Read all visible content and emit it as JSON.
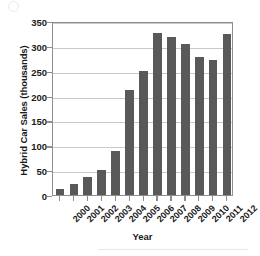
{
  "chart_data": {
    "type": "bar",
    "title": "",
    "xlabel": "Year",
    "ylabel": "Hybrid Car Sales (thousands)",
    "categories": [
      "2000",
      "2001",
      "2002",
      "2003",
      "2004",
      "2005",
      "2006",
      "2007",
      "2008",
      "2009",
      "2010",
      "2011",
      "2012"
    ],
    "values": [
      12,
      22,
      37,
      50,
      88,
      212,
      250,
      326,
      317,
      303,
      277,
      271,
      324
    ],
    "ylim": [
      0,
      350
    ],
    "yticks": [
      0,
      50,
      100,
      150,
      200,
      250,
      300,
      350
    ],
    "ytick_labels": [
      "0",
      "50",
      "100",
      "150",
      "200",
      "250",
      "300",
      "350"
    ],
    "grid": "horizontal",
    "legend": "none",
    "series": [
      {
        "name": "Hybrid Car Sales",
        "color": "#595959",
        "values": [
          12,
          22,
          37,
          50,
          88,
          212,
          250,
          326,
          317,
          303,
          277,
          271,
          324
        ]
      }
    ]
  },
  "figure": {
    "axis_color": "#8e8e8e",
    "grid_color": "#c9c9c9",
    "bar_color": "#595959",
    "background": "#ffffff"
  }
}
